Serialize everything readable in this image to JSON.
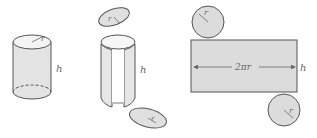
{
  "diagram": {
    "colors": {
      "fill": "#dcdcdc",
      "fill_light": "#e8e8e8",
      "stroke": "#555555",
      "label": "#666666"
    },
    "figures": [
      {
        "id": "cylinder",
        "labels": {
          "radius": "r",
          "height": "h"
        }
      },
      {
        "id": "cut-cylinder",
        "labels": {
          "top_radius": "r",
          "bottom_radius": "r",
          "height": "h"
        }
      },
      {
        "id": "net",
        "labels": {
          "top_radius": "r",
          "width": "2πr",
          "height": "h",
          "bottom_radius": "r"
        }
      }
    ]
  }
}
